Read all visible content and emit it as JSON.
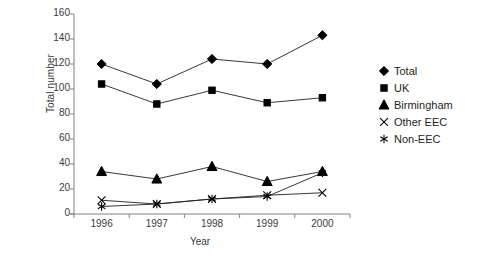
{
  "chart_data": {
    "type": "line",
    "title": "",
    "xlabel": "Year",
    "ylabel": "Total number",
    "categories": [
      "1996",
      "1997",
      "1998",
      "1999",
      "2000"
    ],
    "x": [
      1996,
      1997,
      1998,
      1999,
      2000
    ],
    "ylim": [
      0,
      160
    ],
    "ytick_values": [
      0,
      20,
      40,
      60,
      80,
      100,
      120,
      140,
      160
    ],
    "ytick_labels": [
      "0",
      "20",
      "40",
      "60",
      "80",
      "100",
      "120",
      "140",
      "160"
    ],
    "grid": false,
    "legend_position": "right",
    "line_color": "#231f20",
    "marker_color": "#000000",
    "axis_color": "#808080",
    "series": [
      {
        "name": "Total",
        "marker": "diamond",
        "values": [
          120,
          104,
          124,
          120,
          143
        ]
      },
      {
        "name": "UK",
        "marker": "square",
        "values": [
          104,
          88,
          99,
          89,
          93
        ]
      },
      {
        "name": "Birmingham",
        "marker": "triangle",
        "values": [
          34,
          28,
          38,
          26,
          34
        ]
      },
      {
        "name": "Other EEC",
        "marker": "cross",
        "values": [
          11,
          8,
          12,
          15,
          17
        ]
      },
      {
        "name": "Non-EEC",
        "marker": "asterisk",
        "values": [
          6,
          8,
          12,
          14,
          33
        ]
      }
    ]
  },
  "legend": {
    "items": [
      {
        "label": "Total",
        "marker": "diamond"
      },
      {
        "label": "UK",
        "marker": "square"
      },
      {
        "label": "Birmingham",
        "marker": "triangle"
      },
      {
        "label": "Other EEC",
        "marker": "cross"
      },
      {
        "label": "Non-EEC",
        "marker": "asterisk"
      }
    ]
  }
}
